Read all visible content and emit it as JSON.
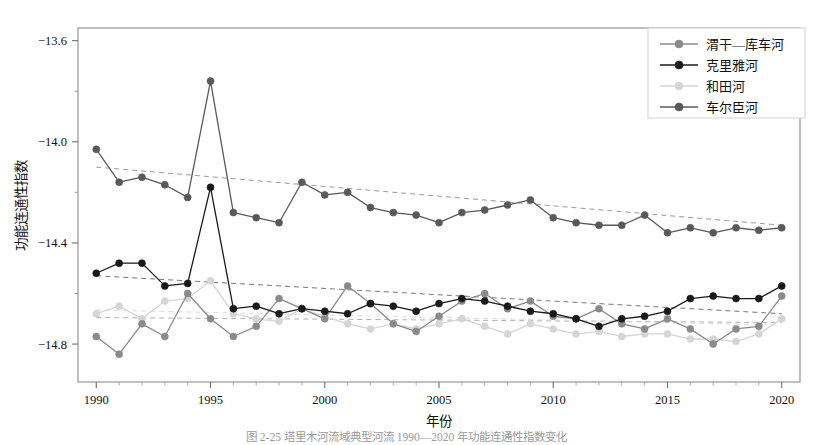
{
  "figure": {
    "caption": "图 2-25  塔里木河流域典型河流 1990—2020 年功能连通性指数变化"
  },
  "chart_data": {
    "type": "line",
    "title": "",
    "xlabel": "年份",
    "ylabel": "功能连通性指数",
    "xlim": [
      1989.2,
      2020.8
    ],
    "ylim": [
      -14.95,
      -13.55
    ],
    "xticks": [
      1990,
      1995,
      2000,
      2005,
      2010,
      2015,
      2020
    ],
    "xticklabels": [
      "1990",
      "1995",
      "2000",
      "2005",
      "2010",
      "2015",
      "2020"
    ],
    "yticks": [
      -13.6,
      -14.0,
      -14.4,
      -14.8
    ],
    "yticklabels": [
      "−13.6",
      "−14.0",
      "−14.4",
      "−14.8"
    ],
    "yminorticks": [
      -13.8,
      -14.2,
      -14.6
    ],
    "grid": false,
    "legend_position": "top-right",
    "x": [
      1990,
      1991,
      1992,
      1993,
      1994,
      1995,
      1996,
      1997,
      1998,
      1999,
      2000,
      2001,
      2002,
      2003,
      2004,
      2005,
      2006,
      2007,
      2008,
      2009,
      2010,
      2011,
      2012,
      2013,
      2014,
      2015,
      2016,
      2017,
      2018,
      2019,
      2020
    ],
    "series": [
      {
        "name": "渭干—库车河",
        "color": "#8a8a8a",
        "marker": "circle",
        "values": [
          -14.77,
          -14.84,
          -14.72,
          -14.77,
          -14.6,
          -14.7,
          -14.77,
          -14.73,
          -14.62,
          -14.66,
          -14.7,
          -14.57,
          -14.64,
          -14.72,
          -14.75,
          -14.69,
          -14.63,
          -14.6,
          -14.66,
          -14.63,
          -14.69,
          -14.7,
          -14.66,
          -14.72,
          -14.74,
          -14.7,
          -14.74,
          -14.8,
          -14.74,
          -14.73,
          -14.61
        ],
        "trend": {
          "start": -14.695,
          "end": -14.715,
          "color": "#b0b0b0",
          "style": "dashed"
        }
      },
      {
        "name": "克里雅河",
        "color": "#1a1a1a",
        "marker": "circle",
        "values": [
          -14.52,
          -14.48,
          -14.48,
          -14.57,
          -14.56,
          -14.18,
          -14.66,
          -14.65,
          -14.68,
          -14.66,
          -14.67,
          -14.68,
          -14.64,
          -14.65,
          -14.67,
          -14.64,
          -14.62,
          -14.63,
          -14.65,
          -14.67,
          -14.68,
          -14.7,
          -14.73,
          -14.7,
          -14.69,
          -14.67,
          -14.62,
          -14.61,
          -14.62,
          -14.62,
          -14.57
        ],
        "trend": {
          "start": -14.53,
          "end": -14.68,
          "color": "#777777",
          "style": "dashed"
        }
      },
      {
        "name": "和田河",
        "color": "#d5d5d5",
        "marker": "circle",
        "values": [
          -14.68,
          -14.65,
          -14.7,
          -14.63,
          -14.62,
          -14.55,
          -14.68,
          -14.7,
          -14.71,
          -14.66,
          -14.69,
          -14.72,
          -14.74,
          -14.72,
          -14.74,
          -14.72,
          -14.7,
          -14.73,
          -14.76,
          -14.72,
          -14.74,
          -14.76,
          -14.75,
          -14.77,
          -14.76,
          -14.76,
          -14.78,
          -14.78,
          -14.79,
          -14.76,
          -14.7
        ],
        "trend": {
          "start": -14.665,
          "end": -14.725,
          "color": "#dcdcdc",
          "style": "dashed"
        }
      },
      {
        "name": "车尔臣河",
        "color": "#595959",
        "marker": "circle",
        "values": [
          -14.03,
          -14.16,
          -14.14,
          -14.17,
          -14.22,
          -13.76,
          -14.28,
          -14.3,
          -14.32,
          -14.16,
          -14.21,
          -14.2,
          -14.26,
          -14.28,
          -14.29,
          -14.32,
          -14.28,
          -14.27,
          -14.25,
          -14.23,
          -14.3,
          -14.32,
          -14.33,
          -14.33,
          -14.29,
          -14.36,
          -14.34,
          -14.36,
          -14.34,
          -14.35,
          -14.34
        ],
        "trend": {
          "start": -14.1,
          "end": -14.33,
          "color": "#9a9a9a",
          "style": "dashed"
        }
      }
    ],
    "legend": [
      {
        "label": "渭干—库车河",
        "color": "#8a8a8a"
      },
      {
        "label": "克里雅河",
        "color": "#1a1a1a"
      },
      {
        "label": "和田河",
        "color": "#d5d5d5"
      },
      {
        "label": "车尔臣河",
        "color": "#595959"
      }
    ]
  }
}
